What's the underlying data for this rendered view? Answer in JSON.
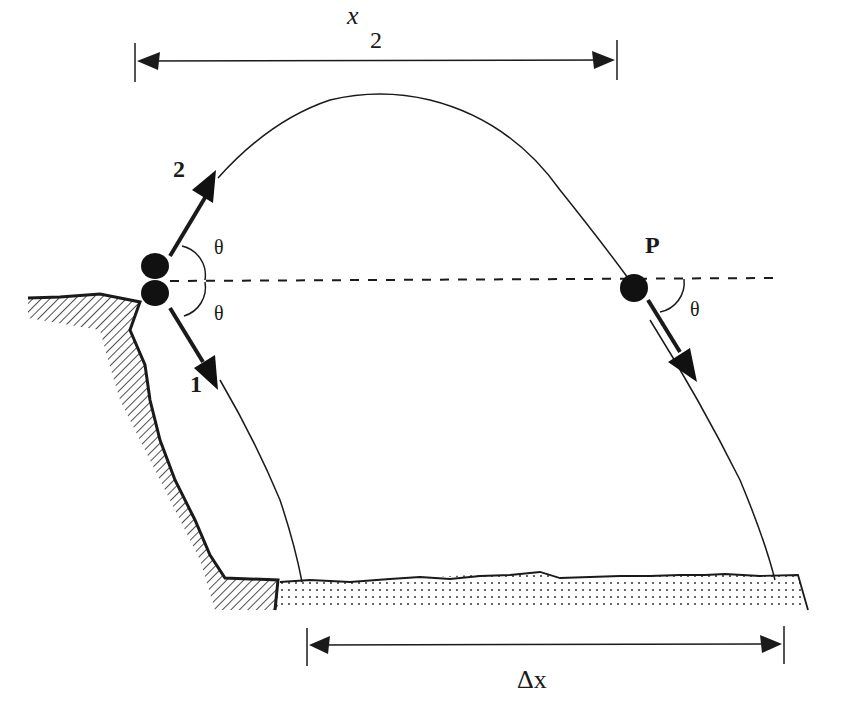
{
  "header_fragment": "which is thrown from the edge of a cliff at the angle θ above the horizontal...",
  "labels": {
    "x2_main": "x",
    "x2_sub": "2",
    "ball2": "2",
    "ball1": "1",
    "point_p": "P",
    "theta_upper": "θ",
    "theta_lower": "θ",
    "theta_p": "θ",
    "delta_x": "Δx"
  },
  "colors": {
    "ink": "#1a1a1a",
    "background": "#ffffff"
  }
}
